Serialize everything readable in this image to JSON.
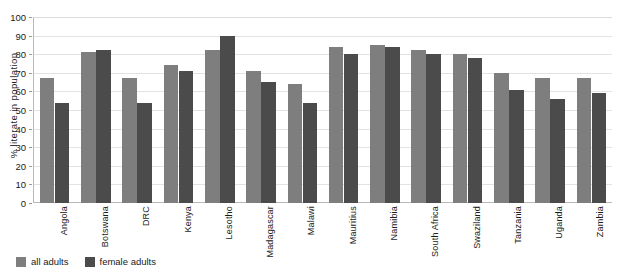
{
  "chart_data": {
    "type": "bar",
    "title": "",
    "xlabel": "",
    "ylabel": "% literate in population",
    "ylim": [
      0,
      100
    ],
    "ytick_step": 10,
    "yticks": [
      0,
      10,
      20,
      30,
      40,
      50,
      60,
      70,
      80,
      90,
      100
    ],
    "grid": true,
    "legend_position": "bottom-left",
    "categories": [
      "Angola",
      "Botswana",
      "DRC",
      "Kenya",
      "Lesotho",
      "Madagascar",
      "Malawi",
      "Mauritius",
      "Namibia",
      "South Africa",
      "Swaziland",
      "Tanzania",
      "Uganda",
      "Zambia"
    ],
    "series": [
      {
        "name": "all adults",
        "color": "#7e7e7e",
        "values": [
          67,
          81,
          67,
          74,
          82,
          71,
          64,
          84,
          85,
          82,
          80,
          70,
          67,
          67
        ]
      },
      {
        "name": "female adults",
        "color": "#4b4b4b",
        "values": [
          54,
          82,
          54,
          71,
          90,
          65,
          54,
          80,
          84,
          80,
          78,
          61,
          56,
          59
        ]
      }
    ]
  },
  "legend": {
    "items": [
      {
        "label": "all adults",
        "color": "#7e7e7e"
      },
      {
        "label": "female adults",
        "color": "#4b4b4b"
      }
    ]
  }
}
